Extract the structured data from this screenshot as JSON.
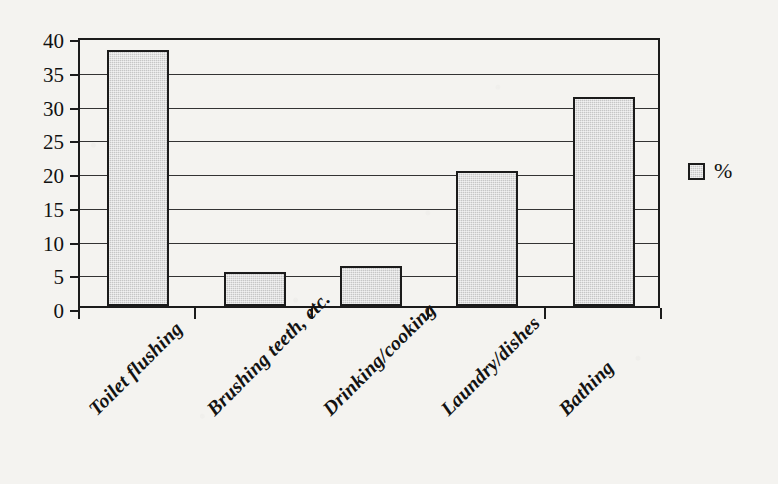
{
  "chart_data": {
    "type": "bar",
    "title": "",
    "xlabel": "",
    "ylabel": "",
    "categories": [
      "Toilet flushing",
      "Brushing teeth, etc.",
      "Drinking/cooking",
      "Laundry/dishes",
      "Bathing"
    ],
    "values": [
      38,
      5,
      6,
      20,
      31
    ],
    "series": [
      {
        "name": "%",
        "values": [
          38,
          5,
          6,
          20,
          31
        ]
      }
    ],
    "ylim": [
      0,
      40
    ],
    "ytick_labels": [
      "0",
      "5",
      "10",
      "15",
      "20",
      "25",
      "30",
      "35",
      "40"
    ],
    "ytick_values": [
      0,
      5,
      10,
      15,
      20,
      25,
      30,
      35,
      40
    ],
    "grid": "horizontal",
    "legend": {
      "position": "right",
      "entries": [
        "%"
      ]
    },
    "colors": {
      "bar_fill": "#c6c6c6",
      "bar_border": "#1b1b1b",
      "grid": "#333333",
      "axis": "#1b1b1b",
      "text": "#111111",
      "background": "#f4f3f0"
    }
  },
  "legend": {
    "swatch_name": "percent-swatch",
    "label": "%"
  }
}
